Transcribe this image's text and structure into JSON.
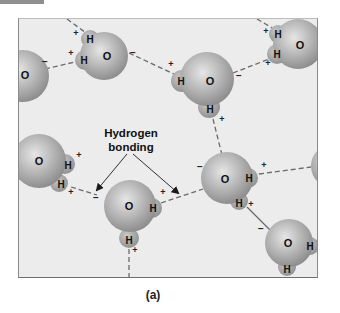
{
  "figure": {
    "caption": "(a)",
    "annotation": {
      "line1": "Hydrogen",
      "line2": "bonding"
    },
    "colors": {
      "background": "#ececec",
      "molecule_light": "#d8d8d8",
      "molecule_dark": "#8c8c8c",
      "bond_dash": "#6a6a6a",
      "frame": "#8a8a8a",
      "top_tab": "#8f8f8f"
    },
    "atoms": {
      "oxygen": "O",
      "hydrogen": "H"
    },
    "charges": {
      "positive": "+",
      "negative": "−"
    },
    "molecules": [
      {
        "id": "m1",
        "label_o": "O"
      },
      {
        "id": "m2",
        "label_o": "O",
        "label_h1": "H",
        "label_h2": "H"
      },
      {
        "id": "m3",
        "label_o": "O",
        "label_h1": "H",
        "label_h2": "H"
      },
      {
        "id": "m4",
        "label_o": "O",
        "label_h1": "H",
        "label_h2": "H"
      },
      {
        "id": "m5",
        "label_o": "O",
        "label_h1": "H",
        "label_h2": "H"
      },
      {
        "id": "m6",
        "label_o": "O",
        "label_h1": "H",
        "label_h2": "H"
      },
      {
        "id": "m7",
        "label_o": "O",
        "label_h1": "H",
        "label_h2": "H"
      },
      {
        "id": "m8",
        "label_o": "O",
        "label_h1": "H",
        "label_h2": "H"
      },
      {
        "id": "m9"
      }
    ]
  }
}
